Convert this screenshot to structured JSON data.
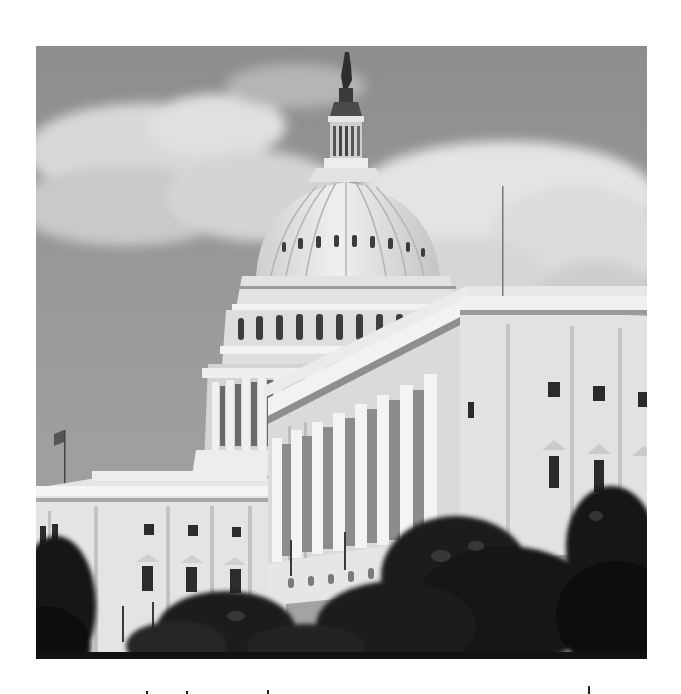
{
  "image": {
    "subject": "United States Capitol building",
    "description": "Grayscale photograph of the U.S. Capitol dome and Senate wing with cloudy sky and trees in the foreground",
    "style": "black-and-white photograph"
  },
  "palette": {
    "sky": "#9a9a9a",
    "sky_dark": "#8a8a8a",
    "cloud": "#dcdcdc",
    "building": "#e8e8e8",
    "building_shade": "#b8b8b8",
    "window": "#2a2a2a",
    "trees": "#1c1c1c",
    "page_background": "#ffffff"
  }
}
